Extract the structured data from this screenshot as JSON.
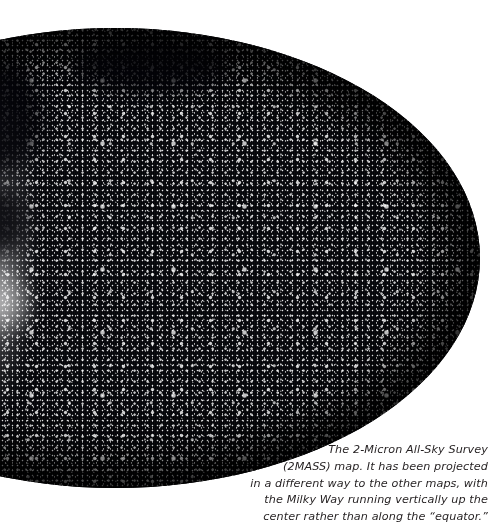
{
  "figure": {
    "kind": "all-sky-star-map",
    "survey_name": "2-Micron All-Sky Survey",
    "survey_abbrev": "2MASS",
    "projection_note": "Milky Way running vertically up the center rather than along the equator",
    "background_color": "#ffffff",
    "map_color": "#05060a",
    "star_color": "#ffffff",
    "text_color": "#231f20"
  },
  "caption": {
    "lines": [
      "The 2-Micron All-Sky Survey",
      "(2MASS) map. It has been projected",
      "in a different way to the other maps, with",
      "the Milky Way running vertically up the",
      "center rather than along the “equator.”"
    ],
    "full_text": "The 2-Micron All-Sky Survey (2MASS) map. It has been projected in a different way to the other maps, with the Milky Way running vertically up the center rather than along the “equator.”"
  }
}
